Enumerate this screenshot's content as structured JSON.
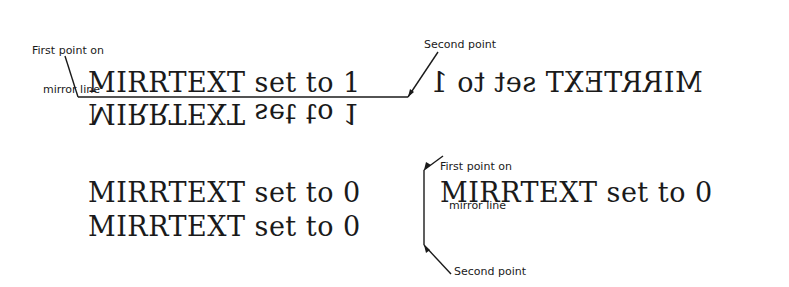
{
  "diagram": {
    "top_example": {
      "label_first_point_line1": "First point on",
      "label_first_point_line2": "mirror line",
      "label_second_point": "Second point",
      "original_text": "MIRRTEXT set to 1",
      "mirrored_below_text": "MIRRTEXT set to 1",
      "mirrored_right_text": "MIRRTEXT set to 1",
      "mirrtext_value": 1
    },
    "bottom_example": {
      "label_first_point_line1": "First point on",
      "label_first_point_line2": "mirror line",
      "label_second_point": "Second point",
      "original_text_line1": "MIRRTEXT set to 0",
      "original_text_line2": "MIRRTEXT set to 0",
      "mirrored_right_text": "MIRRTEXT set to 0",
      "mirrtext_value": 0
    },
    "colors": {
      "ink": "#1a1a1a",
      "background": "#ffffff"
    }
  }
}
